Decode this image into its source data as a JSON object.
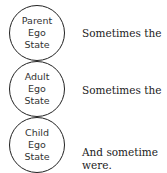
{
  "states": [
    {
      "lines": [
        "Parent",
        "Ego",
        "State"
      ],
      "caption": "Sometimes the"
    },
    {
      "lines": [
        "Adult",
        "Ego",
        "State"
      ],
      "caption": "Sometimes the"
    },
    {
      "lines": [
        "Child",
        "Ego",
        "State"
      ],
      "caption": "And sometime",
      "caption2": "were."
    }
  ]
}
